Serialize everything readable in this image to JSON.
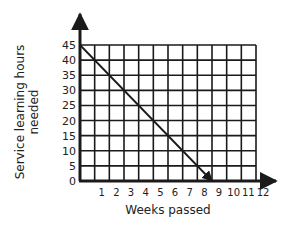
{
  "chart_data": {
    "type": "line",
    "title": "",
    "xlabel": "Weeks passed",
    "ylabel_lines": [
      "Service learning hours",
      "needed"
    ],
    "ylabel": "Service learning hours needed",
    "x_ticks": [
      "0",
      "1",
      "2",
      "3",
      "4",
      "5",
      "6",
      "7",
      "8",
      "9",
      "10",
      "11",
      "12"
    ],
    "y_ticks": [
      "0",
      "5",
      "10",
      "15",
      "20",
      "25",
      "30",
      "35",
      "40",
      "45"
    ],
    "xlim": [
      0,
      12
    ],
    "ylim": [
      0,
      45
    ],
    "grid": true,
    "series": [
      {
        "name": "Hours needed",
        "x": [
          0,
          9
        ],
        "y": [
          45,
          0
        ],
        "end_arrow": true
      }
    ],
    "colors": {
      "line": "#1a1a1a",
      "grid": "#1a1a1a",
      "background": "#ffffff"
    }
  }
}
